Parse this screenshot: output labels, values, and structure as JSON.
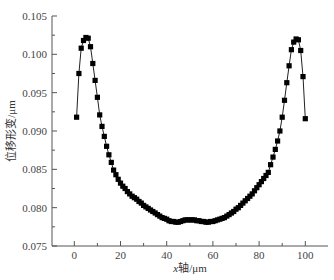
{
  "chart_data": {
    "type": "line",
    "title": "",
    "xlabel": "x轴/μm",
    "xlabel_parts": {
      "italic": "x",
      "rest": "轴/μm"
    },
    "ylabel": "位移形变/μm",
    "xlim": [
      -9.5,
      110
    ],
    "ylim": [
      0.075,
      0.105
    ],
    "xticks": [
      0,
      20,
      40,
      60,
      80,
      100
    ],
    "xtick_labels": [
      "0",
      "20",
      "40",
      "60",
      "80",
      "100"
    ],
    "xminor": [
      10,
      30,
      50,
      70,
      90
    ],
    "yticks": [
      0.075,
      0.08,
      0.085,
      0.09,
      0.095,
      0.1,
      0.105
    ],
    "ytick_labels": [
      "0.075",
      "0.080",
      "0.085",
      "0.090",
      "0.095",
      "0.100",
      "0.105"
    ],
    "yminor": [
      0.0775,
      0.0825,
      0.0875,
      0.0925,
      0.0975,
      0.1025
    ],
    "grid": false,
    "legend": null,
    "marker": "square",
    "color": "#000000",
    "series": [
      {
        "name": "位移形变",
        "x": [
          1,
          2,
          3,
          4,
          5,
          6,
          7,
          8,
          9,
          10,
          11,
          12,
          13,
          14,
          15,
          16,
          17,
          18,
          19,
          20,
          21,
          22,
          23,
          24,
          25,
          26,
          27,
          28,
          29,
          30,
          31,
          32,
          33,
          34,
          35,
          36,
          37,
          38,
          39,
          40,
          41,
          42,
          43,
          44,
          45,
          46,
          47,
          48,
          49,
          50,
          51,
          52,
          53,
          54,
          55,
          56,
          57,
          58,
          59,
          60,
          61,
          62,
          63,
          64,
          65,
          66,
          67,
          68,
          69,
          70,
          71,
          72,
          73,
          74,
          75,
          76,
          77,
          78,
          79,
          80,
          81,
          82,
          83,
          84,
          85,
          86,
          87,
          88,
          89,
          90,
          91,
          92,
          93,
          94,
          95,
          96,
          97,
          98,
          99,
          100
        ],
        "values": [
          0.0918,
          0.0975,
          0.1008,
          0.1018,
          0.1022,
          0.1021,
          0.101,
          0.0988,
          0.0966,
          0.0944,
          0.0921,
          0.0906,
          0.0893,
          0.088,
          0.0869,
          0.0859,
          0.0849,
          0.0843,
          0.0837,
          0.0832,
          0.0828,
          0.0825,
          0.0821,
          0.0818,
          0.0815,
          0.0813,
          0.0811,
          0.0808,
          0.0806,
          0.0803,
          0.0801,
          0.0799,
          0.0797,
          0.0795,
          0.0793,
          0.0791,
          0.0789,
          0.0787,
          0.0786,
          0.0785,
          0.0783,
          0.0782,
          0.0782,
          0.0781,
          0.0781,
          0.0782,
          0.0783,
          0.0784,
          0.0784,
          0.0784,
          0.0784,
          0.0784,
          0.0783,
          0.0783,
          0.0782,
          0.0782,
          0.0781,
          0.0781,
          0.0782,
          0.0782,
          0.0783,
          0.0784,
          0.0785,
          0.0786,
          0.0787,
          0.0789,
          0.0791,
          0.0793,
          0.0795,
          0.0798,
          0.08,
          0.0803,
          0.0806,
          0.0809,
          0.0812,
          0.0815,
          0.0818,
          0.0822,
          0.0826,
          0.083,
          0.0834,
          0.0838,
          0.0842,
          0.0846,
          0.0856,
          0.0866,
          0.0876,
          0.0887,
          0.09,
          0.0918,
          0.094,
          0.0963,
          0.0985,
          0.1006,
          0.1016,
          0.102,
          0.1019,
          0.1005,
          0.0971,
          0.0916
        ]
      }
    ]
  }
}
